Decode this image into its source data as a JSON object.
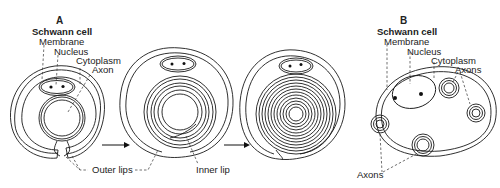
{
  "figure": {
    "panel_a": {
      "label": "A",
      "title": "Schwann cell",
      "labels": {
        "membrane": "Membrane",
        "nucleus": "Nucleus",
        "cytoplasm": "Cytoplasm",
        "axon": "Axon",
        "outer_lips": "Outer lips",
        "inner_lip": "Inner lip"
      },
      "stages": [
        "initial envelopment",
        "early wrapping",
        "compact myelin"
      ]
    },
    "panel_b": {
      "label": "B",
      "title": "Schwann cell",
      "labels": {
        "membrane": "Membrane",
        "nucleus": "Nucleus",
        "cytoplasm": "Cytoplasm",
        "axons_top": "Axons",
        "axons_bottom": "Axons"
      }
    }
  }
}
